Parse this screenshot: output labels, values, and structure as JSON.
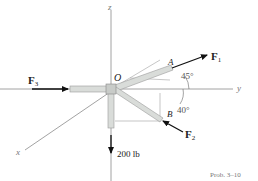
{
  "diagram": {
    "axes": {
      "z": "z",
      "y": "y",
      "x": "x"
    },
    "origin_label": "O",
    "points": {
      "A": "A",
      "B": "B"
    },
    "forces": {
      "F1": {
        "symbol": "F",
        "subscript": "1"
      },
      "F2": {
        "symbol": "F",
        "subscript": "2"
      },
      "F3": {
        "symbol": "F",
        "subscript": "3"
      },
      "weight": "200 lb"
    },
    "angles": {
      "upper": "45°",
      "lower": "40°"
    },
    "caption": "Prob. 3–10"
  },
  "colors": {
    "axis": "#888888",
    "pipe_fill": "#d9dcd9",
    "pipe_edge": "#9a9a9a",
    "arrow": "#111111",
    "text": "#222222"
  }
}
